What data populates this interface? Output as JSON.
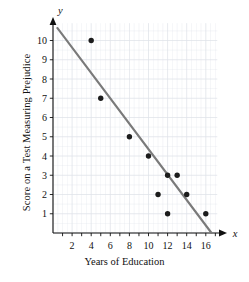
{
  "chart_data": {
    "type": "scatter",
    "title": "",
    "xlabel": "Years of Education",
    "ylabel": "Score on a Test Measuring Prejudice",
    "x_axis_name": "x",
    "y_axis_name": "y",
    "xlim": [
      0,
      17.2
    ],
    "ylim": [
      0,
      10.9
    ],
    "grid": true,
    "legend": "none",
    "xticks": [
      2,
      4,
      6,
      8,
      10,
      12,
      14,
      16
    ],
    "xtick_labels": [
      "2",
      "4",
      "6",
      "8",
      "10",
      "12",
      "14",
      "16"
    ],
    "yticks": [
      1,
      2,
      3,
      4,
      5,
      6,
      7,
      8,
      9,
      10
    ],
    "ytick_labels": [
      "1",
      "2",
      "3",
      "4",
      "5",
      "6",
      "7",
      "8",
      "9",
      "10"
    ],
    "points": [
      {
        "x": 4,
        "y": 10
      },
      {
        "x": 5,
        "y": 7
      },
      {
        "x": 8,
        "y": 5
      },
      {
        "x": 10,
        "y": 4
      },
      {
        "x": 11,
        "y": 2
      },
      {
        "x": 12,
        "y": 3
      },
      {
        "x": 12,
        "y": 1
      },
      {
        "x": 13,
        "y": 3
      },
      {
        "x": 14,
        "y": 2
      },
      {
        "x": 16,
        "y": 1
      }
    ],
    "trendline": {
      "label": "regression line",
      "x_start": 0.45,
      "y_start": 10.65,
      "x_end": 16.6,
      "y_end": 0.0
    },
    "colors": {
      "point": "#1c1c1c",
      "line": "#7a7a7a",
      "axis": "#111111",
      "grid": "#dfe3ea",
      "background": "#ffffff"
    }
  }
}
